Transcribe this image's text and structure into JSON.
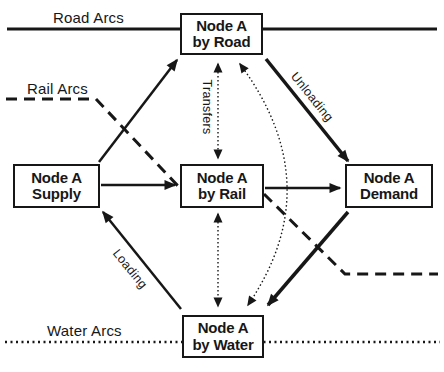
{
  "page": {
    "background": "#ffffff",
    "ink": "#171717"
  },
  "arc_labels": {
    "road": "Road Arcs",
    "rail": "Rail Arcs",
    "water": "Water Arcs"
  },
  "nodes": {
    "road": {
      "line1": "Node A",
      "line2": "by Road"
    },
    "supply": {
      "line1": "Node A",
      "line2": "Supply"
    },
    "rail": {
      "line1": "Node A",
      "line2": "by Rail"
    },
    "demand": {
      "line1": "Node A",
      "line2": "Demand"
    },
    "water": {
      "line1": "Node A",
      "line2": "by Water"
    }
  },
  "flow_labels": {
    "transfers": "Transfers",
    "unloading": "Unloading",
    "loading": "Loading"
  }
}
